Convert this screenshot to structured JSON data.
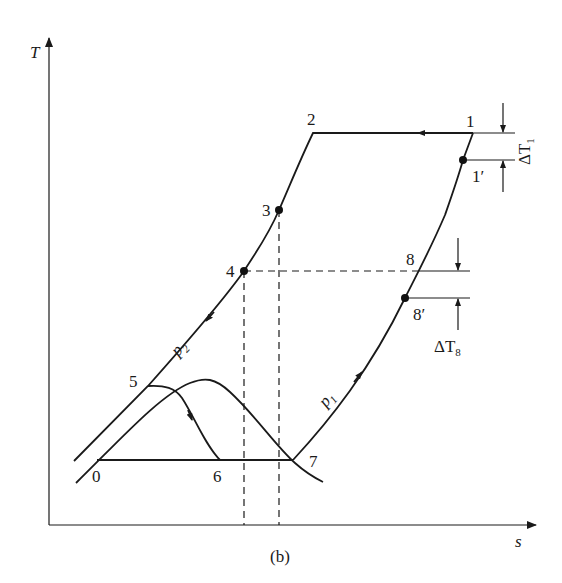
{
  "figure": {
    "caption": "(b)",
    "axes": {
      "y_label": "T",
      "x_label": "s"
    },
    "points": {
      "p0": "0",
      "p1": "1",
      "p1prime": "1′",
      "p2": "2",
      "p3": "3",
      "p4": "4",
      "p5": "5",
      "p6": "6",
      "p7": "7",
      "p8": "8",
      "p8prime": "8′"
    },
    "isobars": {
      "p1": "p",
      "p1_sub": "1",
      "p2": "p",
      "p2_sub": "2"
    },
    "annotations": {
      "dT1": "ΔT",
      "dT1_sub": "1",
      "dT8": "ΔT",
      "dT8_sub": "8"
    },
    "colors": {
      "ink": "#1a1a1a",
      "background": "#ffffff"
    }
  }
}
